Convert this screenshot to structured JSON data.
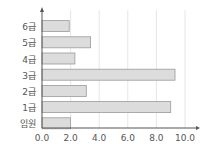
{
  "chart_data": {
    "type": "bar",
    "orientation": "horizontal",
    "title": "",
    "xlabel": "",
    "ylabel": "",
    "categories": [
      "6급",
      "5급",
      "4급",
      "3급",
      "2급",
      "1급",
      "임원"
    ],
    "values": [
      1.9,
      3.4,
      2.3,
      9.3,
      3.1,
      9.0,
      2.0
    ],
    "xlim": [
      0,
      10
    ],
    "xticks": [
      "0.0",
      "2.0",
      "4.0",
      "6.0",
      "8.0",
      "10.0"
    ],
    "grid": "vertical",
    "legend": null,
    "bar_color": "#dcdcdc",
    "bar_border": "#9a9a9a",
    "grid_color": "#e6e6e6",
    "axis_color": "#555555"
  }
}
